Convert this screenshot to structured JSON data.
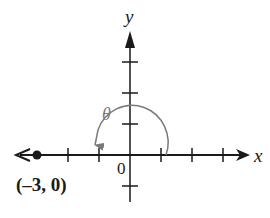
{
  "diagram": {
    "type": "coordinate-plane-angle",
    "x_axis_label": "x",
    "y_axis_label": "y",
    "origin_label": "0",
    "angle_label": "θ",
    "point": {
      "x": -3,
      "y": 0,
      "label": "(–3, 0)"
    },
    "x_ticks": [
      -3,
      -2,
      -1,
      1,
      2,
      3
    ],
    "y_ticks": [
      -1,
      1,
      2,
      3
    ],
    "angle_direction": "counterclockwise",
    "angle_start_deg": 0,
    "angle_end_deg": 180
  },
  "colors": {
    "axes": "#1a1a1a",
    "arc": "#7a7a7a",
    "background": "#ffffff"
  }
}
